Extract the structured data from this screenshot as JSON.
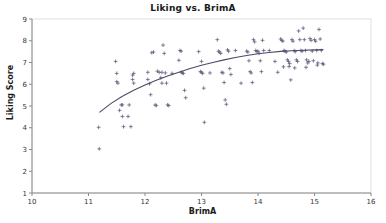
{
  "chart_data": {
    "type": "scatter",
    "title": "Liking vs. BrimA",
    "xlabel": "BrimA",
    "ylabel": "Liking Score",
    "xlim": [
      10,
      16
    ],
    "ylim": [
      1,
      9
    ],
    "xticks": [
      10,
      11,
      12,
      13,
      14,
      15,
      16
    ],
    "yticks": [
      1,
      2,
      3,
      4,
      5,
      6,
      7,
      8,
      9
    ],
    "grid": false,
    "legend": "none",
    "marker": "plus",
    "marker_color": "#5a5a78",
    "line_color": "#4a4a68",
    "points": [
      [
        11.18,
        4.02
      ],
      [
        11.19,
        3.03
      ],
      [
        11.48,
        7.05
      ],
      [
        11.5,
        6.5
      ],
      [
        11.5,
        6.12
      ],
      [
        11.52,
        6.05
      ],
      [
        11.55,
        4.8
      ],
      [
        11.58,
        5.05
      ],
      [
        11.6,
        5.05
      ],
      [
        11.6,
        4.52
      ],
      [
        11.62,
        4.05
      ],
      [
        11.7,
        4.52
      ],
      [
        11.72,
        5.05
      ],
      [
        11.75,
        4.05
      ],
      [
        11.78,
        6.42
      ],
      [
        11.78,
        6.22
      ],
      [
        11.8,
        6.5
      ],
      [
        11.8,
        6.05
      ],
      [
        12.05,
        6.55
      ],
      [
        12.08,
        6.02
      ],
      [
        12.1,
        5.52
      ],
      [
        12.12,
        7.45
      ],
      [
        12.15,
        7.48
      ],
      [
        12.18,
        5.05
      ],
      [
        12.2,
        5.02
      ],
      [
        12.22,
        6.6
      ],
      [
        12.25,
        6.55
      ],
      [
        12.28,
        6.3
      ],
      [
        12.3,
        6.55
      ],
      [
        12.3,
        6.05
      ],
      [
        12.32,
        7.8
      ],
      [
        12.34,
        7.42
      ],
      [
        12.36,
        6.52
      ],
      [
        12.38,
        6.05
      ],
      [
        12.4,
        5.05
      ],
      [
        12.42,
        5.02
      ],
      [
        12.6,
        7.1
      ],
      [
        12.62,
        7.55
      ],
      [
        12.64,
        7.52
      ],
      [
        12.64,
        6.55
      ],
      [
        12.66,
        6.52
      ],
      [
        12.68,
        6.5
      ],
      [
        12.7,
        5.72
      ],
      [
        12.72,
        5.38
      ],
      [
        12.95,
        7.5
      ],
      [
        12.98,
        6.58
      ],
      [
        13.0,
        7.05
      ],
      [
        13.0,
        6.55
      ],
      [
        13.02,
        6.5
      ],
      [
        13.04,
        5.82
      ],
      [
        13.05,
        4.25
      ],
      [
        13.28,
        8.05
      ],
      [
        13.3,
        7.52
      ],
      [
        13.32,
        7.48
      ],
      [
        13.34,
        7.42
      ],
      [
        13.36,
        6.55
      ],
      [
        13.38,
        6.52
      ],
      [
        13.4,
        6.08
      ],
      [
        13.42,
        5.28
      ],
      [
        13.44,
        5.08
      ],
      [
        13.46,
        7.58
      ],
      [
        13.48,
        7.52
      ],
      [
        13.5,
        6.72
      ],
      [
        13.52,
        6.45
      ],
      [
        13.8,
        7.52
      ],
      [
        13.82,
        7.48
      ],
      [
        13.84,
        7.08
      ],
      [
        13.86,
        6.58
      ],
      [
        13.88,
        6.52
      ],
      [
        13.9,
        6.08
      ],
      [
        13.92,
        8.05
      ],
      [
        13.94,
        7.95
      ],
      [
        13.96,
        7.55
      ],
      [
        13.98,
        7.5
      ],
      [
        14.0,
        7.52
      ],
      [
        14.02,
        7.42
      ],
      [
        14.04,
        7.08
      ],
      [
        14.06,
        6.58
      ],
      [
        14.08,
        8.02
      ],
      [
        14.1,
        7.55
      ],
      [
        14.4,
        8.08
      ],
      [
        14.42,
        8.02
      ],
      [
        14.44,
        7.98
      ],
      [
        14.46,
        7.55
      ],
      [
        14.48,
        7.52
      ],
      [
        14.5,
        7.48
      ],
      [
        14.52,
        7.12
      ],
      [
        14.54,
        7.05
      ],
      [
        14.56,
        6.95
      ],
      [
        14.58,
        6.2
      ],
      [
        14.6,
        8.05
      ],
      [
        14.62,
        7.98
      ],
      [
        14.64,
        7.55
      ],
      [
        14.66,
        7.5
      ],
      [
        14.68,
        7.12
      ],
      [
        14.7,
        7.05
      ],
      [
        14.72,
        8.45
      ],
      [
        14.74,
        8.05
      ],
      [
        14.76,
        7.55
      ],
      [
        14.78,
        7.52
      ],
      [
        14.8,
        8.58
      ],
      [
        14.82,
        8.05
      ],
      [
        14.84,
        7.55
      ],
      [
        14.86,
        7.12
      ],
      [
        14.88,
        6.98
      ],
      [
        14.9,
        7.05
      ],
      [
        14.92,
        8.1
      ],
      [
        14.94,
        8.02
      ],
      [
        14.96,
        7.52
      ],
      [
        14.98,
        7.08
      ],
      [
        15.0,
        8.05
      ],
      [
        15.02,
        7.98
      ],
      [
        15.04,
        7.55
      ],
      [
        15.06,
        6.98
      ],
      [
        15.08,
        8.52
      ],
      [
        15.1,
        8.08
      ],
      [
        15.12,
        7.55
      ],
      [
        15.14,
        6.95
      ],
      [
        15.16,
        6.92
      ],
      [
        12.05,
        6.22
      ],
      [
        12.48,
        6.5
      ],
      [
        13.15,
        6.52
      ],
      [
        13.6,
        7.55
      ],
      [
        13.7,
        6.05
      ],
      [
        14.2,
        7.55
      ],
      [
        14.3,
        7.05
      ],
      [
        14.35,
        6.55
      ],
      [
        14.45,
        6.8
      ],
      [
        14.55,
        6.82
      ],
      [
        14.65,
        6.75
      ],
      [
        14.85,
        6.78
      ],
      [
        15.05,
        6.88
      ]
    ],
    "trend_line": {
      "description": "fitted curve (concave, rising then flattening)",
      "points": [
        [
          11.2,
          4.72
        ],
        [
          11.4,
          5.12
        ],
        [
          11.6,
          5.45
        ],
        [
          11.8,
          5.72
        ],
        [
          12.0,
          5.97
        ],
        [
          12.2,
          6.18
        ],
        [
          12.4,
          6.38
        ],
        [
          12.6,
          6.55
        ],
        [
          12.8,
          6.72
        ],
        [
          13.0,
          6.87
        ],
        [
          13.2,
          7.0
        ],
        [
          13.4,
          7.12
        ],
        [
          13.6,
          7.23
        ],
        [
          13.8,
          7.32
        ],
        [
          14.0,
          7.4
        ],
        [
          14.2,
          7.46
        ],
        [
          14.4,
          7.51
        ],
        [
          14.6,
          7.54
        ],
        [
          14.8,
          7.56
        ],
        [
          15.0,
          7.58
        ],
        [
          15.15,
          7.6
        ]
      ]
    }
  }
}
